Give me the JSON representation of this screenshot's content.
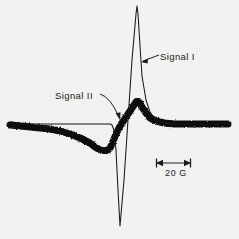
{
  "figure": {
    "kind": "epr-derivative-spectrum",
    "background_color": "#f4f4f2",
    "ink_color": "#111111"
  },
  "annotations": {
    "signal_i_label": "Signal I",
    "signal_ii_label": "Signal II",
    "scale_bar_label": "20 G"
  },
  "scale_bar": {
    "label": "20 G",
    "value": 20,
    "unit": "G",
    "x_start": 156,
    "x_end": 191,
    "y": 163
  },
  "chart_data": {
    "type": "line",
    "title": "",
    "subtitle": "",
    "xlabel": "",
    "ylabel": "",
    "grid": false,
    "legend_position": "inline-annotations",
    "annotations": [
      {
        "text": "Signal I",
        "x": 160,
        "y": 57,
        "points_to_x": 141,
        "points_to_y": 62
      },
      {
        "text": "Signal II",
        "x": 55,
        "y": 96,
        "points_to_x": 121,
        "points_to_y": 119
      },
      {
        "text": "20 G",
        "x": 173,
        "y": 174
      }
    ],
    "x": [
      10,
      20,
      30,
      40,
      50,
      60,
      70,
      80,
      90,
      95,
      100,
      104,
      108,
      110,
      112,
      114,
      116,
      118,
      120,
      124,
      128,
      132,
      136,
      137,
      138,
      140,
      142,
      146,
      150,
      156,
      164,
      174,
      186,
      200,
      214,
      228
    ],
    "series": [
      {
        "name": "Signal I",
        "style": "thin-sharp-line",
        "linewidth": 1,
        "noisy": false,
        "values": [
          124,
          124,
          124,
          124,
          124,
          124,
          124,
          124,
          124,
          124,
          124,
          124,
          124,
          124,
          125,
          130,
          150,
          190,
          226,
          180,
          120,
          60,
          14,
          6,
          14,
          46,
          76,
          100,
          112,
          120,
          123,
          124,
          124,
          124,
          124,
          124
        ]
      },
      {
        "name": "Signal II",
        "style": "thick-noisy-trace",
        "linewidth": 7,
        "noisy": true,
        "values": [
          125,
          126,
          127,
          128,
          129,
          131,
          134,
          138,
          143,
          147,
          150,
          151,
          150,
          148,
          144,
          139,
          134,
          130,
          126,
          120,
          114,
          108,
          102,
          101,
          101,
          103,
          107,
          113,
          118,
          121,
          123,
          124,
          124,
          124,
          124,
          124
        ]
      }
    ],
    "ylim": [
      239,
      0
    ],
    "xlim": [
      0,
      239
    ],
    "y_axis_inverted": true
  }
}
